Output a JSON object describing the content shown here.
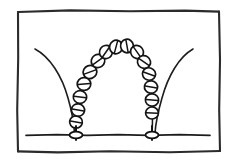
{
  "figure": {
    "title": "Hand-drawn arch of beads diagram",
    "background_color": "#ffffff",
    "ink_color": "#1a1a1a",
    "canvas": {
      "width": 235,
      "height": 161
    },
    "frame": {
      "label": "rectangular border",
      "x": 17,
      "y": 11,
      "width": 203,
      "height": 141,
      "stroke_color": "#2b2b2b"
    },
    "ground": {
      "label": "ground line",
      "y": 135,
      "x_start": 26,
      "x_end": 210,
      "stroke_color": "#1c1c1c"
    },
    "arch": {
      "label": "chain of circles forming an arch",
      "bead_count": 15,
      "apex_y": 45,
      "left_foot_x": 76,
      "right_foot_x": 152,
      "bead_radius": 6.2,
      "bead_fill": "#ffffff",
      "bead_stroke": "#141414",
      "beads": [
        {
          "cx": 76,
          "cy": 122,
          "r": 6.0,
          "angle": 100
        },
        {
          "cx": 78,
          "cy": 110,
          "r": 6.2,
          "angle": 100
        },
        {
          "cx": 80,
          "cy": 97,
          "r": 6.3,
          "angle": 96
        },
        {
          "cx": 84,
          "cy": 84,
          "r": 6.4,
          "angle": 85
        },
        {
          "cx": 90,
          "cy": 72,
          "r": 6.5,
          "angle": 70
        },
        {
          "cx": 98,
          "cy": 61,
          "r": 6.5,
          "angle": 55
        },
        {
          "cx": 106,
          "cy": 52,
          "r": 6.4,
          "angle": 35
        },
        {
          "cx": 116,
          "cy": 47,
          "r": 6.4,
          "angle": 15
        },
        {
          "cx": 127,
          "cy": 46,
          "r": 6.4,
          "angle": 350
        },
        {
          "cx": 137,
          "cy": 52,
          "r": 6.3,
          "angle": 325
        },
        {
          "cx": 144,
          "cy": 62,
          "r": 6.3,
          "angle": 305
        },
        {
          "cx": 149,
          "cy": 74,
          "r": 6.2,
          "angle": 290
        },
        {
          "cx": 151,
          "cy": 87,
          "r": 6.2,
          "angle": 280
        },
        {
          "cx": 152,
          "cy": 100,
          "r": 6.2,
          "angle": 275
        },
        {
          "cx": 152,
          "cy": 113,
          "r": 6.0,
          "angle": 272
        }
      ]
    },
    "feet": [
      {
        "label": "left foot",
        "cx": 76,
        "cy": 135,
        "rx": 6.5,
        "ry": 3.4
      },
      {
        "label": "right foot",
        "cx": 152,
        "cy": 135,
        "rx": 6.5,
        "ry": 3.4
      }
    ],
    "whiskers": [
      {
        "label": "left outer curve",
        "start_x": 35,
        "start_y": 49,
        "end_x": 74,
        "end_y": 133,
        "stroke_color": "#1e1e1e"
      },
      {
        "label": "right outer curve",
        "start_x": 193,
        "start_y": 49,
        "end_x": 155,
        "end_y": 133,
        "stroke_color": "#1e1e1e"
      }
    ]
  }
}
